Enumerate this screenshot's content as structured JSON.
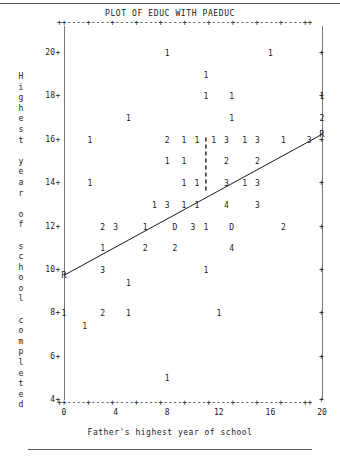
{
  "plot": {
    "title": "PLOT OF EDUC WITH PAEDUC",
    "xaxis_title": "Father's highest year of school",
    "yaxis_title": "Highest year of school completed",
    "frame_tick_row": "++----+----+----+----+----+----+----+----+----+----++",
    "regression_marker": "R",
    "line_color": "#1a1a1a",
    "text_color": "#1a1a1a"
  },
  "chart_data": {
    "type": "scatter",
    "title": "PLOT OF EDUC WITH PAEDUC",
    "xlabel": "Father's highest year of school",
    "ylabel": "Highest year of school completed",
    "xlim": [
      0,
      20
    ],
    "ylim": [
      4,
      20
    ],
    "xticks": [
      0,
      4,
      8,
      12,
      16,
      20
    ],
    "xtick_labels": [
      "0",
      "4",
      "8",
      "12",
      "16",
      "20"
    ],
    "yticks": [
      4,
      6,
      8,
      10,
      12,
      14,
      16,
      18,
      20
    ],
    "ytick_labels": [
      "4",
      "6",
      "8",
      "10",
      "12",
      "14",
      "16",
      "18",
      "20"
    ],
    "grid": false,
    "legend": null,
    "notation": "Character-cell plot: each glyph is a count of cases at that cell; 'D' denotes 13 cases, 'R' marks the fitted regression line endpoints.",
    "points": [
      {
        "x": 8,
        "y": 20,
        "label": "1"
      },
      {
        "x": 16,
        "y": 20,
        "label": "1"
      },
      {
        "x": 11,
        "y": 19,
        "label": "1"
      },
      {
        "x": 11,
        "y": 18,
        "label": "1"
      },
      {
        "x": 13,
        "y": 18,
        "label": "1"
      },
      {
        "x": 20,
        "y": 18,
        "label": "1"
      },
      {
        "x": 5,
        "y": 17,
        "label": "1"
      },
      {
        "x": 13,
        "y": 17,
        "label": "1"
      },
      {
        "x": 20,
        "y": 17,
        "label": "2"
      },
      {
        "x": 2,
        "y": 16,
        "label": "1"
      },
      {
        "x": 8,
        "y": 16,
        "label": "2"
      },
      {
        "x": 9.3,
        "y": 16,
        "label": "1"
      },
      {
        "x": 10.3,
        "y": 16,
        "label": "1"
      },
      {
        "x": 11.6,
        "y": 16,
        "label": "1"
      },
      {
        "x": 12.6,
        "y": 16,
        "label": "3"
      },
      {
        "x": 14,
        "y": 16,
        "label": "1"
      },
      {
        "x": 15,
        "y": 16,
        "label": "3"
      },
      {
        "x": 17,
        "y": 16,
        "label": "1"
      },
      {
        "x": 19,
        "y": 16,
        "label": "3"
      },
      {
        "x": 8,
        "y": 15,
        "label": "1"
      },
      {
        "x": 9.3,
        "y": 15,
        "label": "1"
      },
      {
        "x": 12.6,
        "y": 15,
        "label": "2"
      },
      {
        "x": 15,
        "y": 15,
        "label": "2"
      },
      {
        "x": 2,
        "y": 14,
        "label": "1"
      },
      {
        "x": 9.3,
        "y": 14,
        "label": "1"
      },
      {
        "x": 10.3,
        "y": 14,
        "label": "1"
      },
      {
        "x": 12.6,
        "y": 14,
        "label": "3"
      },
      {
        "x": 14,
        "y": 14,
        "label": "1"
      },
      {
        "x": 15,
        "y": 14,
        "label": "3"
      },
      {
        "x": 7,
        "y": 13,
        "label": "1"
      },
      {
        "x": 8,
        "y": 13,
        "label": "3"
      },
      {
        "x": 9.3,
        "y": 13,
        "label": "1"
      },
      {
        "x": 10.3,
        "y": 13,
        "label": "1"
      },
      {
        "x": 12.6,
        "y": 13,
        "label": "4"
      },
      {
        "x": 15,
        "y": 13,
        "label": "3"
      },
      {
        "x": 3,
        "y": 12,
        "label": "2"
      },
      {
        "x": 4,
        "y": 12,
        "label": "3"
      },
      {
        "x": 6.3,
        "y": 12,
        "label": "1"
      },
      {
        "x": 8.6,
        "y": 12,
        "label": "D"
      },
      {
        "x": 10,
        "y": 12,
        "label": "3"
      },
      {
        "x": 11,
        "y": 12,
        "label": "1"
      },
      {
        "x": 13,
        "y": 12,
        "label": "D"
      },
      {
        "x": 17,
        "y": 12,
        "label": "2"
      },
      {
        "x": 3,
        "y": 11,
        "label": "1"
      },
      {
        "x": 6.3,
        "y": 11,
        "label": "2"
      },
      {
        "x": 8.6,
        "y": 11,
        "label": "2"
      },
      {
        "x": 13,
        "y": 11,
        "label": "4"
      },
      {
        "x": 3,
        "y": 10,
        "label": "3"
      },
      {
        "x": 11,
        "y": 10,
        "label": "1"
      },
      {
        "x": 5,
        "y": 9.4,
        "label": "1"
      },
      {
        "x": 0,
        "y": 8,
        "label": "1"
      },
      {
        "x": 3,
        "y": 8,
        "label": "2"
      },
      {
        "x": 5,
        "y": 8,
        "label": "1"
      },
      {
        "x": 12,
        "y": 8,
        "label": "1"
      },
      {
        "x": 1.6,
        "y": 7.4,
        "label": "1"
      },
      {
        "x": 8,
        "y": 5,
        "label": "1"
      }
    ],
    "regression_line": {
      "x0": 0,
      "y0": 9.75,
      "x1": 20,
      "y1": 16.25,
      "endpoint_marker": "R",
      "style": "solid"
    },
    "reference_line": {
      "x": 11,
      "y0": 13.6,
      "y1": 16.1,
      "style": "dashed",
      "orientation": "vertical"
    }
  }
}
